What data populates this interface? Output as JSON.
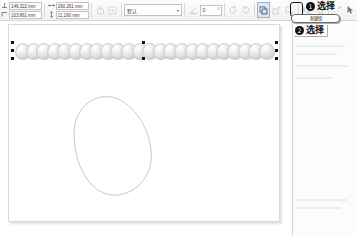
{
  "app": {
    "title": "Vector Graphics Editor Canvas"
  },
  "toolbar": {
    "position_x": {
      "label": "x-position",
      "value": "146.322 mm",
      "icon": "x-coordinate-icon"
    },
    "position_y": {
      "label": "y-position",
      "value": "103.861 mm",
      "icon": "y-coordinate-icon"
    },
    "width": {
      "label": "width",
      "value": "260.261 mm",
      "icon": "width-arrow-icon"
    },
    "height": {
      "label": "height",
      "value": "11.190 mm",
      "icon": "height-arrow-icon"
    },
    "lock_ratio_icon": "lock-ratio-icon",
    "style_combo": {
      "value": "默认",
      "caret": "▾"
    },
    "angle_field": {
      "value": "0",
      "spin_up": "▴",
      "spin_down": "▾"
    },
    "icons": [
      {
        "name": "rotate-left-icon",
        "glyph": "rotate-left"
      },
      {
        "name": "rotate-right-icon",
        "glyph": "rotate-right"
      },
      {
        "name": "flip-horizontal-icon",
        "glyph": "flip-h"
      },
      {
        "name": "flip-vertical-icon",
        "glyph": "flip-v"
      },
      {
        "name": "raise-to-top-icon",
        "glyph": "layer-top"
      },
      {
        "name": "raise-icon",
        "glyph": "layer-up"
      },
      {
        "name": "lower-icon",
        "glyph": "layer-down"
      },
      {
        "name": "lower-to-bottom-icon",
        "glyph": "layer-bottom"
      },
      {
        "name": "group-icon",
        "glyph": "group"
      },
      {
        "name": "ungroup-icon",
        "glyph": "ungroup"
      },
      {
        "name": "enter-group-icon",
        "glyph": "enter-group"
      },
      {
        "name": "transform-icon",
        "glyph": "transform"
      }
    ],
    "selection_tool_icon": "selection-arrow-icon"
  },
  "canvas": {
    "page_name": "drawing-page",
    "sphere_count": 24,
    "sphere_shape": "egg-sphere",
    "selection": {
      "handles_left": 3,
      "handles_right": 3,
      "handle_color": "#111111"
    },
    "egg_outline": {
      "name": "egg-outline-path",
      "stroke": "#c9c9c9"
    }
  },
  "right_panel": {
    "name": "properties-panel"
  },
  "annotations": [
    {
      "id": 1,
      "bullet": "❶",
      "number": "1",
      "text": "选择",
      "name": "annotation-callout-1"
    },
    {
      "id": 2,
      "bullet": "❷",
      "number": "2",
      "text": "选择",
      "name": "annotation-callout-2"
    }
  ],
  "dropdown": {
    "name": "tool-dropdown-item",
    "label": "新建组"
  },
  "colors": {
    "accent": "#111111",
    "toolbar_bg": "#f1f1f1",
    "page_bg": "#ffffff",
    "sphere_fill": "#e3e3e3",
    "egg_stroke": "#c9c9c9"
  }
}
